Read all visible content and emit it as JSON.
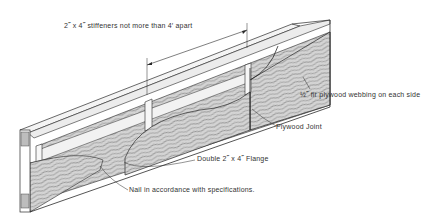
{
  "diagram": {
    "colors": {
      "line": "#2a2a2a",
      "wood_fill": "#cfcfcf",
      "flange_fill": "#f2f2f2",
      "background": "#ffffff"
    },
    "labels": {
      "stiffeners": "2˝ x 4˝ stiffeners not more than 4′ apart",
      "webbing": "½˝ fir plywood webbing on each side",
      "joint": "Plywood Joint",
      "flange": "Double 2˝ x 4˝ Flange",
      "nail": "Nail in accordance with specifications."
    },
    "components": [
      "top-flange",
      "bottom-flange",
      "stiffener",
      "plywood-web-panel",
      "plywood-joint",
      "end-grain-block"
    ]
  }
}
